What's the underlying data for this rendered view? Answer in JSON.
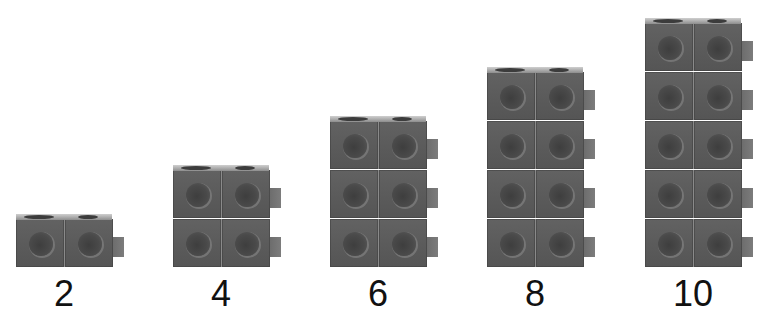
{
  "figure": {
    "columns": [
      {
        "label": "2",
        "count": 2,
        "rows": 1
      },
      {
        "label": "4",
        "count": 4,
        "rows": 2
      },
      {
        "label": "6",
        "count": 6,
        "rows": 3
      },
      {
        "label": "8",
        "count": 8,
        "rows": 4
      },
      {
        "label": "10",
        "count": 10,
        "rows": 5
      }
    ],
    "cube_color": "#5e5e5e",
    "label_color": "#111111"
  }
}
